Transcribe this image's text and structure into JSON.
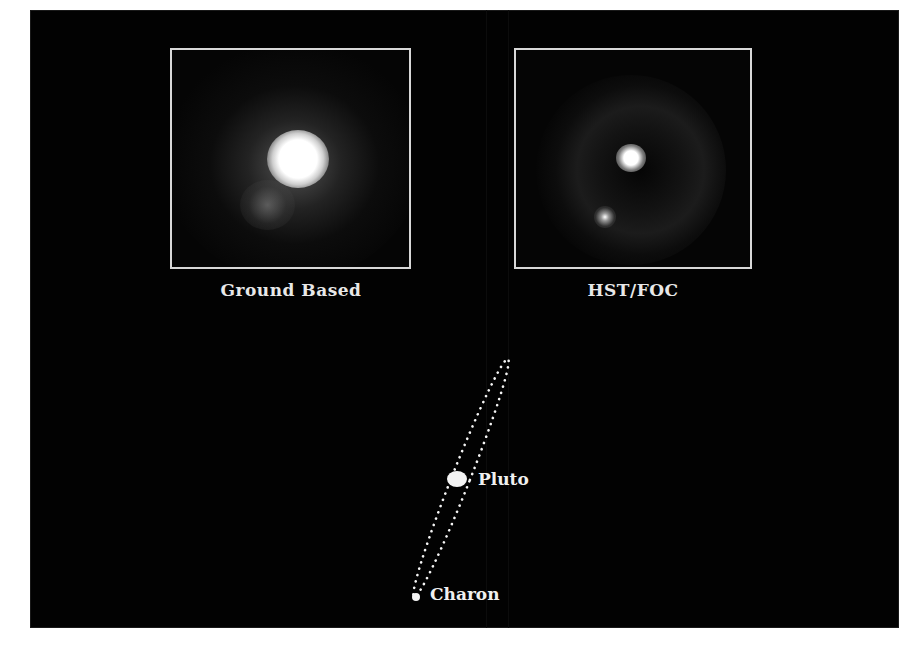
{
  "figure": {
    "background_color": "#020202",
    "panels": [
      {
        "id": "ground",
        "caption": "Ground Based",
        "frame_color": "#d8d8d8",
        "objects": [
          {
            "name": "pluto",
            "appearance": "large blurred saturated blob"
          },
          {
            "name": "charon",
            "appearance": "faint blurred bump lower-left"
          }
        ]
      },
      {
        "id": "hst",
        "caption": "HST/FOC",
        "frame_color": "#d8d8d8",
        "objects": [
          {
            "name": "pluto",
            "appearance": "sharp bright point"
          },
          {
            "name": "charon",
            "appearance": "fainter point lower-left"
          }
        ]
      }
    ],
    "orbit_diagram": {
      "style": "dotted ellipse",
      "labels": {
        "pluto": "Pluto",
        "charon": "Charon"
      }
    }
  }
}
